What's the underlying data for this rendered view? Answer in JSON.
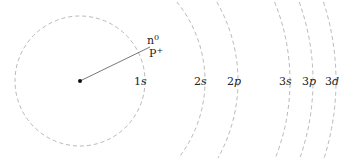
{
  "diagram": {
    "type": "atomic orbital shells",
    "center": {
      "x": 80,
      "y": 81
    },
    "nucleus": {
      "label_neutron": "n",
      "label_neutron_sup": "0",
      "label_proton": "P",
      "label_proton_sup": "+"
    },
    "line_end": {
      "x": 150,
      "y": 47
    },
    "colors": {
      "shell": "#b0b0b0",
      "line": "#555555",
      "text": "#222222",
      "nucleus": "#111111"
    },
    "shells": [
      {
        "n": "1",
        "l": "s",
        "radius": 65,
        "label_x": 134
      },
      {
        "n": "2",
        "l": "s",
        "radius": 125,
        "label_x": 194
      },
      {
        "n": "2",
        "l": "p",
        "radius": 158,
        "label_x": 227
      },
      {
        "n": "3",
        "l": "s",
        "radius": 210,
        "label_x": 279
      },
      {
        "n": "3",
        "l": "p",
        "radius": 233,
        "label_x": 302
      },
      {
        "n": "3",
        "l": "d",
        "radius": 256,
        "label_x": 325
      }
    ]
  }
}
